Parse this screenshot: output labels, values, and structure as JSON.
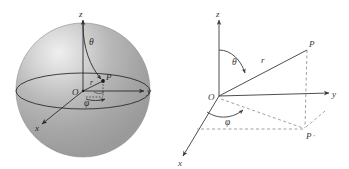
{
  "figure": {
    "background_color": "#ffffff",
    "ink_color": "#2b2b2b",
    "panels": [
      {
        "id": "sphere",
        "name": "shaded-sphere-with-spherical-coordinates",
        "description": "Shaded sphere with z, y, x axes, polar angle theta, azimuth angle phi, radius r and point P",
        "sphere_fill": "#a8a8a8",
        "highlight_color": "#ededed",
        "labels": {
          "z_axis": "z",
          "y_axis": "y",
          "x_axis": "x",
          "origin": "O",
          "point": "P",
          "radius": "r",
          "polar_angle": "θ",
          "azimuth_angle": "φ"
        }
      },
      {
        "id": "axes",
        "name": "spherical-coordinates-axes-diagram",
        "description": "Line drawing of 3D axes with point P, its projection P prime, radius r, polar angle theta and azimuth angle phi",
        "labels": {
          "z_axis": "z",
          "y_axis": "y",
          "x_axis": "x",
          "origin": "O",
          "point": "P",
          "projection_point": "P",
          "projection_prime": "′",
          "radius": "r",
          "polar_angle": "θ",
          "azimuth_angle": "φ"
        }
      }
    ]
  }
}
